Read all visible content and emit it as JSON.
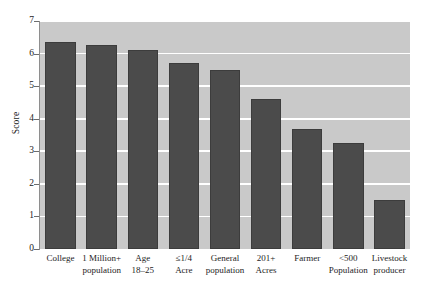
{
  "chart_data": {
    "type": "bar",
    "title": "",
    "xlabel": "",
    "ylabel": "Score",
    "ylim": [
      0,
      7
    ],
    "yticks": [
      0,
      1,
      2,
      3,
      4,
      5,
      6,
      7
    ],
    "ytick_labels": [
      "0",
      "1",
      "2",
      "3",
      "4",
      "5",
      "6",
      "7"
    ],
    "grid": true,
    "grid_axis": "y",
    "legend": "none",
    "bar_color": "#4b4b4b",
    "plot_background": "#c9c9c9",
    "gridline_color": "#ffffff",
    "categories": [
      "College",
      "1 Million+\npopulation",
      "Age\n18–25",
      "≤1/4\nAcre",
      "General\npopulation",
      "201+\nAcres",
      "Farmer",
      "<500\nPopulation",
      "Livestock\nproducer"
    ],
    "values": [
      6.35,
      6.25,
      6.1,
      5.7,
      5.5,
      4.6,
      3.7,
      3.25,
      1.5
    ]
  },
  "axes": {
    "y_title": "Score"
  }
}
